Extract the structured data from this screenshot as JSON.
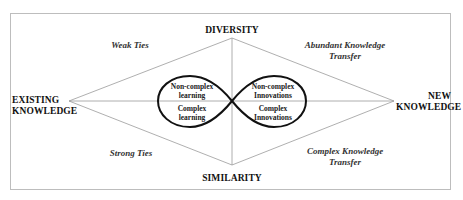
{
  "diagram": {
    "axes": {
      "top": "DIVERSITY",
      "bottom": "SIMILARITY",
      "left_line1": "EXISTING",
      "left_line2": "KNOWLEDGE",
      "right_line1": "NEW",
      "right_line2": "KNOWLEDGE"
    },
    "quadrants": {
      "top_left": "Weak Ties",
      "top_right_line1": "Abundant Knowledge",
      "top_right_line2": "Transfer",
      "bottom_left": "Strong Ties",
      "bottom_right_line1": "Complex Knowledge",
      "bottom_right_line2": "Transfer"
    },
    "left_oval": {
      "upper_line1": "Non-complex",
      "upper_line2": "learning",
      "lower_line1": "Complex",
      "lower_line2": "learning"
    },
    "right_oval": {
      "upper_line1": "Non-complex",
      "upper_line2": "Innovations",
      "lower_line1": "Complex",
      "lower_line2": "Innovations"
    },
    "colors": {
      "frame": "#bdbdbd",
      "diamond_lines": "#9a9a9a",
      "oval_stroke": "#111111"
    }
  }
}
